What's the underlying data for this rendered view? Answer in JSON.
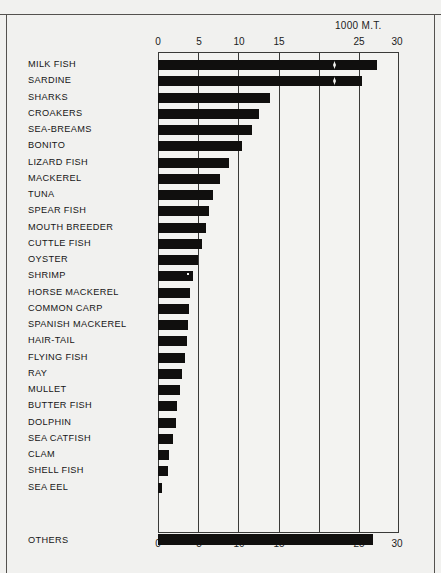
{
  "figure": {
    "unit_caption": "1000 M.T.",
    "background_color": "#f1f1ef",
    "bar_color": "#100f0e",
    "axis_color": "#3a3a38"
  },
  "axis": {
    "top_labels": [
      "0",
      "5",
      "10",
      "15",
      "25",
      "30"
    ],
    "bottom_labels": [
      "0",
      "5",
      "10",
      "15",
      "25",
      "30"
    ],
    "tick_values": [
      0,
      5,
      10,
      15,
      20,
      25,
      30
    ],
    "label_positions_px": [
      158,
      199,
      239,
      279,
      319,
      359,
      397
    ]
  },
  "chart_data": {
    "type": "bar",
    "orientation": "horizontal",
    "title": "",
    "subtitle": "",
    "xlabel": "1000 M.T.",
    "ylabel": "",
    "xlim": [
      0,
      30
    ],
    "grid": true,
    "legend": "none",
    "note": "Top axis tick labels as printed read 0, 5, 10, 15, 25, 30 (the 20 tick is mislabelled 25 in the source). The top two bars (MILK FISH, SARDINE) carry axis-break zigzag marks. The OTHERS bar is drawn outside/below the plot frame.",
    "categories": [
      "MILK FISH",
      "SARDINE",
      "SHARKS",
      "CROAKERS",
      "SEA-BREAMS",
      "BONITO",
      "LIZARD FISH",
      "MACKEREL",
      "TUNA",
      "SPEAR FISH",
      "MOUTH BREEDER",
      "CUTTLE FISH",
      "OYSTER",
      "SHRIMP",
      "HORSE MACKEREL",
      "COMMON CARP",
      "SPANISH MACKEREL",
      "HAIR-TAIL",
      "FLYING FISH",
      "RAY",
      "MULLET",
      "BUTTER FISH",
      "DOLPHIN",
      "SEA CATFISH",
      "CLAM",
      "SHELL FISH",
      "SEA EEL",
      "OTHERS"
    ],
    "values": [
      27.2,
      25.4,
      14.0,
      12.6,
      11.7,
      10.4,
      8.8,
      7.7,
      6.9,
      6.4,
      6.0,
      5.5,
      5.0,
      4.4,
      4.0,
      3.9,
      3.7,
      3.6,
      3.4,
      3.0,
      2.8,
      2.4,
      2.2,
      1.9,
      1.4,
      1.2,
      0.5,
      26.8
    ],
    "breaks": [
      {
        "category": "MILK FISH",
        "at": 21.5
      },
      {
        "category": "SARDINE",
        "at": 21.5
      }
    ]
  }
}
